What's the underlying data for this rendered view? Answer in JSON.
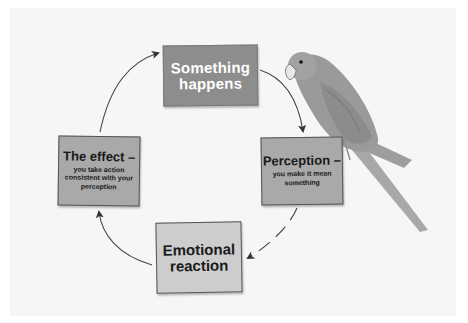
{
  "diagram": {
    "type": "cycle",
    "background_color": "#f6f6f6",
    "nodes": [
      {
        "id": "something",
        "title": "Something happens",
        "title_line1": "Something",
        "title_line2": "happens",
        "subtitle": "",
        "fill": "#8d8d8d",
        "text_color": "#ffffff"
      },
      {
        "id": "perception",
        "title": "Perception –",
        "subtitle": "you make it mean something",
        "sub_line1": "you make it mean",
        "sub_line2": "something",
        "fill": "#a9a9a9",
        "text_color": "#1a1a1a"
      },
      {
        "id": "emotional",
        "title": "Emotional reaction",
        "title_line1": "Emotional",
        "title_line2": "reaction",
        "subtitle": "",
        "fill": "#cdcdcd",
        "text_color": "#1a1a1a"
      },
      {
        "id": "effect",
        "title": "The effect –",
        "subtitle": "you take action consistent with your perception",
        "sub_line1": "you take action",
        "sub_line2": "consistent with your",
        "sub_line3": "perception",
        "fill": "#a9a9a9",
        "text_color": "#1a1a1a"
      }
    ],
    "edges": [
      {
        "from": "something",
        "to": "perception"
      },
      {
        "from": "perception",
        "to": "emotional"
      },
      {
        "from": "emotional",
        "to": "effect"
      },
      {
        "from": "effect",
        "to": "something"
      }
    ],
    "illustration": {
      "subject": "parrot",
      "perched_on": "perception",
      "color": "#9a9a9a"
    }
  }
}
